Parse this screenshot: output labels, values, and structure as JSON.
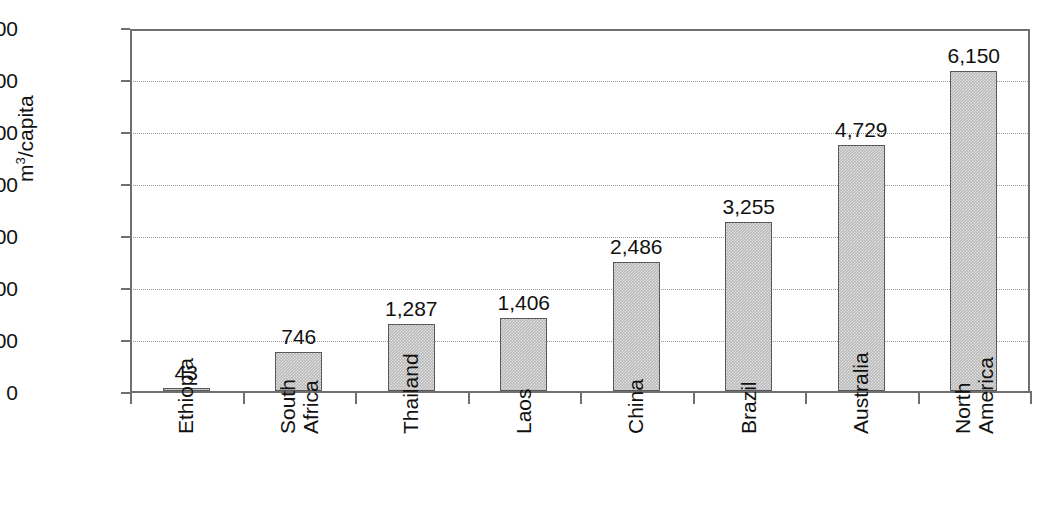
{
  "chart_data": {
    "type": "bar",
    "title": "",
    "xlabel": "",
    "ylabel": "m3/capita",
    "ylabel_html": "m<sup>3</sup>/capita",
    "categories": [
      "Ethiopia",
      "South Africa",
      "Thailand",
      "Laos",
      "China",
      "Brazil",
      "Australia",
      "North America"
    ],
    "values": [
      43,
      746,
      1287,
      1406,
      2486,
      3255,
      4729,
      6150
    ],
    "value_labels": [
      "43",
      "746",
      "1,287",
      "1,406",
      "2,486",
      "3,255",
      "4,729",
      "6,150"
    ],
    "ylim": [
      0,
      7000
    ],
    "ytick_values": [
      0,
      1000,
      2000,
      3000,
      4000,
      5000,
      6000,
      7000
    ],
    "ytick_labels": [
      "0",
      "1,000",
      "2,000",
      "3,000",
      "4,000",
      "5,000",
      "6,000",
      "7,000"
    ],
    "grid": true,
    "grid_style": "dotted",
    "legend": "none",
    "series": [
      {
        "name": "m3/capita",
        "values": [
          43,
          746,
          1287,
          1406,
          2486,
          3255,
          4729,
          6150
        ]
      }
    ],
    "bar_fill_color": "#b9b9b9",
    "bar_edge_color": "#595959",
    "axis_color": "#6f6f6f",
    "gridline_color": "#9a9a9a",
    "text_color": "#111111",
    "background_color": "#ffffff"
  },
  "category_label_lines": [
    [
      "Ethiopia"
    ],
    [
      "South",
      "Africa"
    ],
    [
      "Thailand"
    ],
    [
      "Laos"
    ],
    [
      "China"
    ],
    [
      "Brazil"
    ],
    [
      "Australia"
    ],
    [
      "North",
      "America"
    ]
  ]
}
